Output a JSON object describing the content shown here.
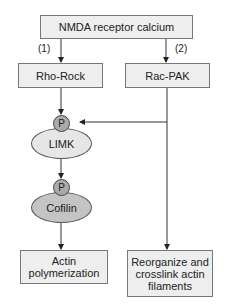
{
  "diagram": {
    "top_node": "NMDA receptor calcium",
    "branch_labels": [
      "(1)",
      "(2)"
    ],
    "left_branch": {
      "node": "Rho-Rock",
      "kinase": {
        "label": "LIMK",
        "phospho": "P"
      },
      "substrate": {
        "label": "Cofilin",
        "phospho": "P"
      },
      "outcome_lines": [
        "Actin",
        "polymerization"
      ]
    },
    "right_branch": {
      "node": "Rac-PAK",
      "outcome_lines": [
        "Reorganize and",
        "crosslink actin",
        "filaments"
      ]
    },
    "colors": {
      "box_fill": "#eeeeee",
      "limk_fill": "#e6e6e6",
      "cofilin_fill": "#c4c4c4",
      "phospho_fill": "#aaaaaa",
      "line": "#333333"
    }
  }
}
